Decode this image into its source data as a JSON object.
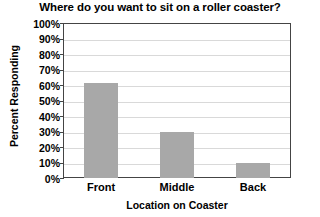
{
  "chart_data": {
    "type": "bar",
    "title": "Where do you want to sit on a roller coaster?",
    "xlabel": "Location on Coaster",
    "ylabel": "Percent Responding",
    "categories": [
      "Front",
      "Middle",
      "Back"
    ],
    "values": [
      61,
      30,
      10
    ],
    "value_labels": [
      "61%",
      "30%",
      "10%"
    ],
    "ylim": [
      0,
      100
    ],
    "ytick_step": 10,
    "ytick_labels": [
      "100%",
      "90%",
      "80%",
      "70%",
      "60%",
      "50%",
      "40%",
      "30%",
      "20%",
      "10%",
      "0%"
    ],
    "ytick_values": [
      100,
      90,
      80,
      70,
      60,
      50,
      40,
      30,
      20,
      10,
      0
    ],
    "grid": true,
    "grid_axis": "y",
    "legend": false,
    "bar_color": "#a8a8a8",
    "grid_color": "#d9d9d9",
    "frame_color": "#444444",
    "background_color": "#ffffff"
  }
}
